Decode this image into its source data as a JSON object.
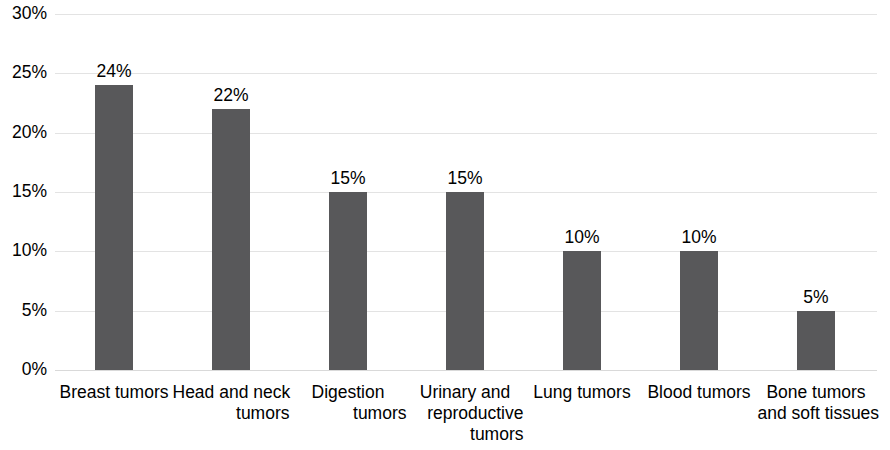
{
  "chart_data": {
    "type": "bar",
    "title": "",
    "xlabel": "",
    "ylabel": "",
    "categories": [
      "Breast tumors",
      "Head and neck tumors",
      "Digestion tumors",
      "Urinary and reproductive tumors",
      "Lung tumors",
      "Blood tumors",
      "Bone tumors and soft tissues"
    ],
    "category_lines": [
      [
        "Breast tumors"
      ],
      [
        "Head and neck",
        "tumors"
      ],
      [
        "Digestion",
        "tumors"
      ],
      [
        "Urinary and",
        "reproductive",
        "tumors"
      ],
      [
        "Lung tumors"
      ],
      [
        "Blood tumors"
      ],
      [
        "Bone tumors",
        "and soft tissues"
      ]
    ],
    "values": [
      24,
      22,
      15,
      15,
      10,
      10,
      5
    ],
    "value_labels": [
      "24%",
      "22%",
      "15%",
      "15%",
      "10%",
      "10%",
      "5%"
    ],
    "ylim": [
      0,
      30
    ],
    "ytick_values": [
      0,
      5,
      10,
      15,
      20,
      25,
      30
    ],
    "ytick_labels": [
      "0%",
      "5%",
      "10%",
      "15%",
      "20%",
      "25%",
      "30%"
    ],
    "grid": true,
    "grid_axis": "y",
    "legend": false,
    "colors": {
      "bar": "#58585a",
      "gridline": "#e3e3e3",
      "baseline": "#d9d9d9",
      "text": "#000000",
      "background": "#ffffff"
    }
  }
}
